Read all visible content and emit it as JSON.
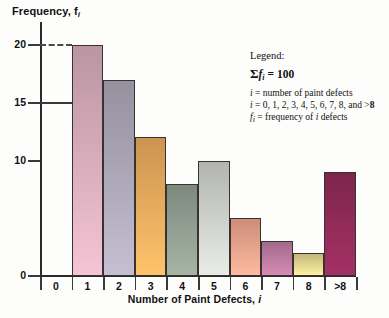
{
  "chart_data": {
    "type": "bar",
    "title": "",
    "xlabel": "Number of Paint Defects, i",
    "ylabel": "Frequency, fi",
    "categories": [
      "0",
      "1",
      "2",
      "3",
      "4",
      "5",
      "6",
      "7",
      "8",
      ">8"
    ],
    "values": [
      0,
      20,
      17,
      12,
      8,
      10,
      5,
      3,
      2,
      9
    ],
    "ylim": [
      0,
      22
    ],
    "yticks": [
      0,
      10,
      15,
      20
    ],
    "ytick_labels": [
      "0",
      "10",
      "15",
      "20"
    ],
    "grid": false,
    "legend_position": "inside-right",
    "bar_colors": [
      "#ffffff",
      "#d3a9b8",
      "#a9a5b5",
      "#e8a85c",
      "#8f9c8f",
      "#c9ccc7",
      "#e8a08a",
      "#b9789e",
      "#ddd08a",
      "#8e2a56"
    ],
    "annotations": [
      {
        "label": "20",
        "type": "dashed-guide",
        "value": 20
      },
      {
        "label": "15",
        "type": "solid-guide",
        "value": 15
      }
    ]
  },
  "axes": {
    "y_title_prefix": "Frequency, f",
    "y_title_sub": "i",
    "x_title_prefix": "Number of Paint Defects, ",
    "x_title_italic": "i"
  },
  "legend": {
    "heading": "Legend:",
    "sum_sigma": "Σ",
    "sum_var": "f",
    "sum_sub": "i",
    "sum_eq": "= 100",
    "line_i_def_var": "i",
    "line_i_def": "= number of paint defects",
    "line_i_vals_var": "i",
    "line_i_vals": "= 0, 1, 2, 3, 4, 5, 6, 7, 8, and >",
    "line_i_vals_bold": "8",
    "line_f_def_var": "f",
    "line_f_def_sub": "i",
    "line_f_def_a": "= frequency of ",
    "line_f_def_b": "i",
    "line_f_def_c": " defects"
  }
}
